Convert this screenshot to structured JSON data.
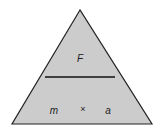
{
  "diagram": {
    "fill": "#cccccc",
    "top": "F",
    "bottom_left": "m",
    "operator": "×",
    "bottom_right": "a"
  }
}
